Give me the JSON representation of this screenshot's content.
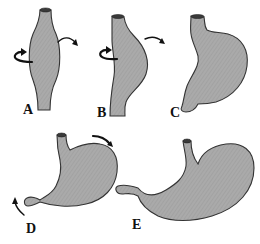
{
  "diagram": {
    "panels": [
      {
        "id": "A",
        "label": "A",
        "shape": "fusiform tube (spindle-shaped dilation)",
        "arrows": [
          "rotation-curl-left",
          "rotation-arrow-right"
        ]
      },
      {
        "id": "B",
        "label": "B",
        "shape": "tube with dorsal wall bulging",
        "arrows": [
          "rotation-curl-left",
          "rotation-arrow-right"
        ]
      },
      {
        "id": "C",
        "label": "C",
        "shape": "early stomach shape with greater curvature",
        "arrows": []
      },
      {
        "id": "D",
        "label": "D",
        "shape": "stomach rotating along anteroposterior axis",
        "arrows": [
          "pylorus-arrow-up",
          "fundus-arrow-right"
        ]
      },
      {
        "id": "E",
        "label": "E",
        "shape": "final adult stomach position",
        "arrows": []
      }
    ],
    "colors": {
      "fill": "#a9a9a9",
      "outline": "#333333",
      "arrow": "#111111",
      "background": "#ffffff"
    }
  }
}
